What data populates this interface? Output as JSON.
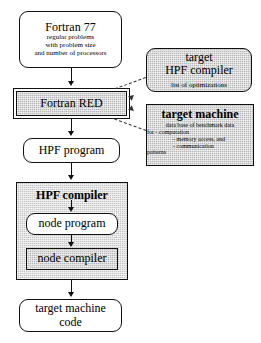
{
  "diagram": {
    "colors": {
      "ink": "#111111",
      "grey_fill": "#b9b9b9",
      "grey_light_fill": "#c6c6c6",
      "paper": "#ffffff"
    },
    "nodes": {
      "fortran77": {
        "title": "Fortran 77",
        "line1": "regular problems",
        "line2": "with  problem size",
        "line3": "and number of processors"
      },
      "fortran_red": {
        "title": "Fortran RED"
      },
      "hpf_program": {
        "title": "HPF program"
      },
      "hpf_compiler": {
        "title": "HPF compiler"
      },
      "node_program": {
        "title": "node program"
      },
      "node_compiler": {
        "title": "node compiler"
      },
      "target_machine_code": {
        "line1": "target machine",
        "line2": "code"
      },
      "target_hpf_compiler": {
        "line1": "target",
        "line2": "HPF compiler",
        "sub": "list of optimizations"
      },
      "target_machine": {
        "title": "target machine",
        "line1": "data base of benchmark data",
        "line2": "for   -  computation",
        "line3": "-  memory access, and",
        "line4": "-  communication",
        "line5": "patterns"
      }
    },
    "edges": {
      "e1_label": "",
      "e2_label": "",
      "e3_label": "",
      "e4_label": "",
      "e5_label": "",
      "e6_label": "",
      "e7_label": ""
    }
  }
}
